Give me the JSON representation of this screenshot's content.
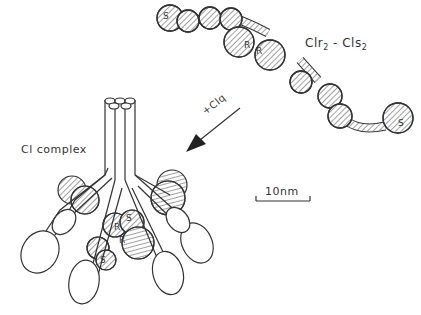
{
  "labels": {
    "dimer": "Clr",
    "dimer_sub1": "2",
    "dimer_sep": " - Cls",
    "dimer_sub2": "2",
    "arrow": "+Clq",
    "complex": "Cl complex",
    "scale": "10nm"
  },
  "bead_labels": {
    "s_left": "S",
    "r1": "R",
    "r2": "R",
    "s_right": "S",
    "complex_r1": "R",
    "complex_r2": "R",
    "complex_s1": "S",
    "complex_s2": "S"
  },
  "colors": {
    "line": "#333333",
    "text": "#333333",
    "background": "#ffffff"
  }
}
